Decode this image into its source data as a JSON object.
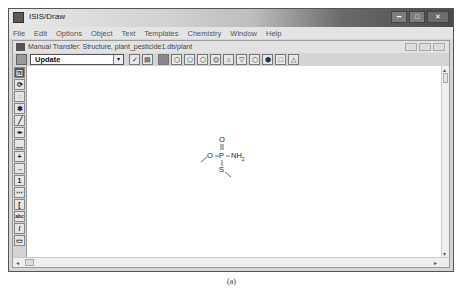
{
  "window": {
    "title": "ISIS/Draw",
    "controls": [
      "minimize",
      "maximize",
      "close"
    ]
  },
  "menubar": {
    "items": [
      "File",
      "Edit",
      "Options",
      "Object",
      "Text",
      "Templates",
      "Chemistry",
      "Window",
      "Help"
    ]
  },
  "document": {
    "title": "Manual Transfer: Structure, plant_pesticide1.db/plant"
  },
  "toolbar": {
    "mode_select": "Update",
    "dropdown_glyph": "▾",
    "buttons": [
      "check-icon",
      "template-icon",
      "select-tool-icon",
      "cyclopropane-icon",
      "cyclopentane-icon",
      "cyclohexane-icon",
      "benzene-icon",
      "cyclobutane-icon",
      "pentagon-down-icon",
      "hexagon-chair-icon",
      "ring-icon",
      "square-icon",
      "triangle-icon"
    ]
  },
  "left_tools": {
    "items": [
      {
        "name": "lasso-select-tool",
        "glyph": "◱"
      },
      {
        "name": "rotate-tool",
        "glyph": "⟳"
      },
      {
        "name": "eraser-tool",
        "glyph": "◌"
      },
      {
        "name": "atom-tool",
        "glyph": "✱"
      },
      {
        "name": "bond-tool",
        "glyph": "╱"
      },
      {
        "name": "pen-tool",
        "glyph": "✒"
      },
      {
        "name": "chain-tool",
        "glyph": "﹏"
      },
      {
        "name": "charge-tool",
        "glyph": "+"
      },
      {
        "name": "arrow-tool",
        "glyph": "→"
      },
      {
        "name": "atom-number-tool",
        "glyph": "1"
      },
      {
        "name": "dotted-bond-tool",
        "glyph": "⋯"
      },
      {
        "name": "bracket-tool",
        "glyph": "["
      },
      {
        "name": "text-tool",
        "glyph": "abc"
      },
      {
        "name": "line-tool",
        "glyph": "/"
      },
      {
        "name": "rectangle-tool",
        "glyph": "▭"
      }
    ]
  },
  "molecule": {
    "atoms": {
      "O_top": "O",
      "P": "P",
      "NH2": "NH",
      "NH2_sub": "2",
      "O_left": "O",
      "S": "S"
    }
  },
  "scrollbars": {
    "up": "▴",
    "down": "▾",
    "left": "◂",
    "right": "▸"
  },
  "caption": "(a)"
}
